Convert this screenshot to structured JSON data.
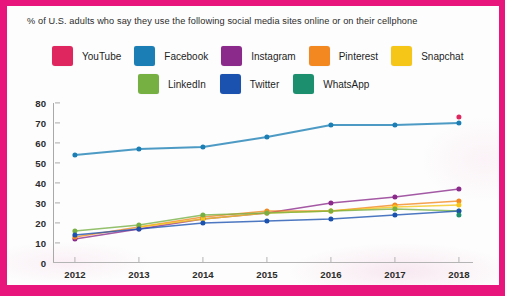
{
  "frame": {
    "border_color": "#e8167c",
    "card_color": "#fdfdfd"
  },
  "title": "% of U.S. adults who say they use the following social media sites online or on their cellphone",
  "legend": {
    "rows": [
      [
        {
          "label": "YouTube",
          "color": "#e0265e"
        },
        {
          "label": "Facebook",
          "color": "#1b7fb5"
        },
        {
          "label": "Instagram",
          "color": "#8b2a8b"
        },
        {
          "label": "Pinterest",
          "color": "#f2881f"
        },
        {
          "label": "Snapchat",
          "color": "#f5c518"
        }
      ],
      [
        {
          "label": "LinkedIn",
          "color": "#76b043"
        },
        {
          "label": "Twitter",
          "color": "#1b52b0"
        },
        {
          "label": "WhatsApp",
          "color": "#1b8f6e"
        }
      ]
    ]
  },
  "chart_data": {
    "type": "line",
    "title": "% of U.S. adults who say they use the following social media sites online or on their cellphone",
    "xlabel": "",
    "ylabel": "",
    "x": [
      "2012",
      "2013",
      "2014",
      "2015",
      "2016",
      "2017",
      "2018"
    ],
    "categories": [
      "2012",
      "2013",
      "2014",
      "2015",
      "2016",
      "2017",
      "2018"
    ],
    "ylim": [
      0,
      80
    ],
    "yticks": [
      0,
      10,
      20,
      30,
      40,
      50,
      60,
      70,
      80
    ],
    "grid": false,
    "legend_position": "top",
    "series": [
      {
        "name": "YouTube",
        "color": "#e0265e",
        "values": [
          null,
          null,
          null,
          null,
          null,
          null,
          73
        ]
      },
      {
        "name": "Facebook",
        "color": "#1b7fb5",
        "values": [
          54,
          57,
          58,
          63,
          69,
          69,
          70
        ]
      },
      {
        "name": "Instagram",
        "color": "#8b2a8b",
        "values": [
          12,
          17,
          22,
          25,
          30,
          33,
          37
        ]
      },
      {
        "name": "Pinterest",
        "color": "#f2881f",
        "values": [
          13,
          18,
          23,
          26,
          26,
          29,
          31
        ]
      },
      {
        "name": "Snapchat",
        "color": "#f5c518",
        "values": [
          null,
          18,
          22,
          25,
          26,
          28,
          29
        ]
      },
      {
        "name": "LinkedIn",
        "color": "#76b043",
        "values": [
          16,
          19,
          24,
          25,
          26,
          27,
          26
        ]
      },
      {
        "name": "Twitter",
        "color": "#1b52b0",
        "values": [
          14,
          17,
          20,
          21,
          22,
          24,
          26
        ]
      },
      {
        "name": "WhatsApp",
        "color": "#1b8f6e",
        "values": [
          null,
          null,
          null,
          null,
          null,
          null,
          24
        ]
      }
    ]
  }
}
